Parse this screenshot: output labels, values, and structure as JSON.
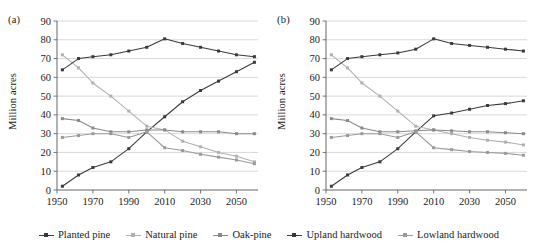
{
  "figure": {
    "panels": [
      {
        "id": "a",
        "label": "(a)",
        "ylabel": "Million acres"
      },
      {
        "id": "b",
        "label": "(b)",
        "ylabel": "Million acres"
      }
    ]
  },
  "legend": {
    "items": [
      {
        "name": "Planted pine",
        "color": "#3a3a3a"
      },
      {
        "name": "Natural pine",
        "color": "#b0b0b0"
      },
      {
        "name": "Oak-pine",
        "color": "#8a8a8a"
      },
      {
        "name": "Upland hardwood",
        "color": "#3a3a3a"
      },
      {
        "name": "Lowland hardwood",
        "color": "#9a9a9a"
      }
    ]
  },
  "axes": {
    "y_ticks": [
      0,
      10,
      20,
      30,
      40,
      50,
      60,
      70,
      80,
      90
    ],
    "y_tick_labels": [
      "0",
      "10",
      "20",
      "30",
      "40",
      "50",
      "60",
      "70",
      "80",
      "90"
    ],
    "x_ticks": [
      1950,
      1970,
      1990,
      2010,
      2030,
      2050
    ],
    "x_tick_labels": [
      "1950",
      "1970",
      "1990",
      "2010",
      "2030",
      "2050"
    ],
    "ylim": [
      0,
      90
    ],
    "xlim": [
      1950,
      2062
    ]
  },
  "chart_data": [
    {
      "type": "line",
      "title": "(a)",
      "xlabel": "",
      "ylabel": "Million acres",
      "xlim": [
        1950,
        2062
      ],
      "ylim": [
        0,
        90
      ],
      "grid": true,
      "legend_position": "bottom-shared",
      "x": [
        1953,
        1962,
        1970,
        1980,
        1990,
        2000,
        2010,
        2020,
        2030,
        2040,
        2050,
        2060
      ],
      "series": [
        {
          "name": "Planted pine",
          "color": "#3a3a3a",
          "values": [
            2,
            8,
            12,
            15,
            22,
            31,
            39,
            47,
            53,
            58,
            63,
            68
          ]
        },
        {
          "name": "Natural pine",
          "color": "#b0b0b0",
          "values": [
            72,
            65,
            57,
            50,
            42,
            34,
            32,
            26,
            23,
            20,
            18,
            15
          ]
        },
        {
          "name": "Oak-pine",
          "color": "#8a8a8a",
          "values": [
            38,
            37,
            33,
            31,
            31,
            32,
            32,
            31,
            31,
            31,
            30,
            30
          ]
        },
        {
          "name": "Upland hardwood",
          "color": "#3a3a3a",
          "values": [
            64,
            70,
            71,
            72,
            74,
            76,
            80.5,
            78,
            76,
            74,
            72,
            71
          ]
        },
        {
          "name": "Lowland hardwood",
          "color": "#9a9a9a",
          "values": [
            28,
            29,
            30,
            30,
            28,
            31,
            22.5,
            21,
            19,
            17.5,
            16,
            14
          ]
        }
      ]
    },
    {
      "type": "line",
      "title": "(b)",
      "xlabel": "",
      "ylabel": "Million acres",
      "xlim": [
        1950,
        2062
      ],
      "ylim": [
        0,
        90
      ],
      "grid": true,
      "legend_position": "bottom-shared",
      "x": [
        1953,
        1962,
        1970,
        1980,
        1990,
        2000,
        2010,
        2020,
        2030,
        2040,
        2050,
        2060
      ],
      "series": [
        {
          "name": "Planted pine",
          "color": "#3a3a3a",
          "values": [
            2,
            8,
            12,
            15,
            22,
            31,
            39.5,
            41,
            43,
            45,
            46,
            47.5
          ]
        },
        {
          "name": "Natural pine",
          "color": "#b0b0b0",
          "values": [
            72,
            65,
            57,
            50,
            42,
            34,
            32,
            30,
            28,
            26.5,
            25.5,
            24
          ]
        },
        {
          "name": "Oak-pine",
          "color": "#8a8a8a",
          "values": [
            38,
            37,
            33,
            31,
            31,
            31.5,
            32,
            31.5,
            31,
            31,
            30.5,
            30
          ]
        },
        {
          "name": "Upland hardwood",
          "color": "#3a3a3a",
          "values": [
            64,
            70,
            71,
            72,
            73,
            75,
            80.5,
            78,
            77,
            76,
            75,
            74
          ]
        },
        {
          "name": "Lowland hardwood",
          "color": "#9a9a9a",
          "values": [
            28,
            29,
            30,
            30,
            28,
            31,
            22.5,
            21.5,
            20.5,
            20,
            19.5,
            18.5
          ]
        }
      ]
    }
  ]
}
